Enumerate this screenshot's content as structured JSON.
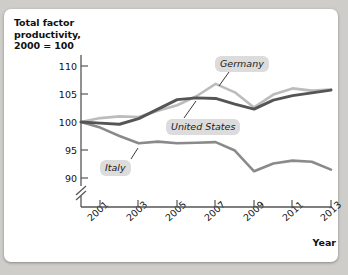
{
  "chart_data": {
    "type": "line",
    "title": "",
    "ylabel": "Total factor productivity, 2000 = 100",
    "xlabel": "Year",
    "x": [
      2000,
      2001,
      2002,
      2003,
      2004,
      2005,
      2006,
      2007,
      2008,
      2009,
      2010,
      2011,
      2012,
      2013
    ],
    "xtick_labels": [
      "2001",
      "2003",
      "2005",
      "2007",
      "2009",
      "2011",
      "2013"
    ],
    "xtick_values": [
      2001,
      2003,
      2005,
      2007,
      2009,
      2011,
      2013
    ],
    "ytick_labels": [
      "110",
      "105",
      "100",
      "95",
      "90"
    ],
    "ytick_values": [
      110,
      105,
      100,
      95,
      90
    ],
    "ylim": [
      88.5,
      111.5
    ],
    "xlim": [
      2000,
      2013
    ],
    "axis_break": true,
    "grid": false,
    "legend_position": "inline-callout",
    "series": [
      {
        "name": "United States",
        "color": "#555555",
        "values": [
          100.0,
          99.8,
          99.6,
          100.6,
          102.3,
          104.0,
          104.3,
          104.2,
          103.2,
          102.3,
          103.9,
          104.7,
          105.2,
          105.7
        ]
      },
      {
        "name": "Germany",
        "color": "#bcbcbc",
        "values": [
          100.0,
          100.7,
          101.0,
          100.9,
          102.0,
          103.0,
          104.6,
          106.8,
          105.3,
          102.6,
          104.9,
          106.0,
          105.6,
          105.8
        ]
      },
      {
        "name": "Italy",
        "color": "#8a8a8a",
        "values": [
          100.0,
          99.0,
          97.5,
          96.2,
          96.5,
          96.2,
          96.3,
          96.4,
          94.9,
          91.2,
          92.6,
          93.1,
          92.9,
          91.5
        ]
      }
    ]
  },
  "labels": {
    "y_axis_title": "Total factor productivity, 2000 = 100",
    "y_axis_title_line1": "Total factor",
    "y_axis_title_line2": "productivity,",
    "y_axis_title_line3": "2000 = 100",
    "x_axis_title": "Year",
    "germany": "Germany",
    "united_states": "United States",
    "italy": "Italy"
  },
  "colors": {
    "united_states": "#555555",
    "germany": "#bcbcbc",
    "italy": "#8a8a8a",
    "axis": "#555555",
    "label_background": "#dcdcdc",
    "card_background": "#ffffff",
    "page_background": "#cfcdc9"
  }
}
